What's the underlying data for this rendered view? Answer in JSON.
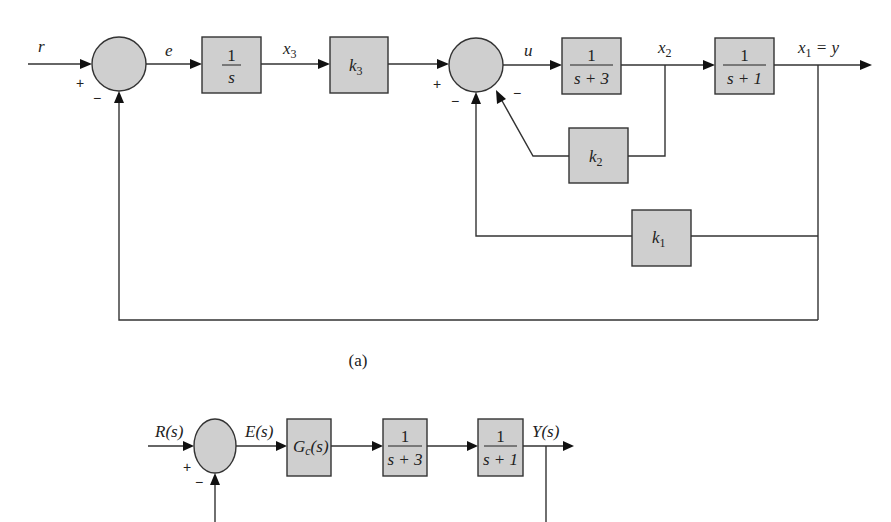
{
  "diagram_a": {
    "caption": "(a)",
    "signals": {
      "r": "r",
      "e": "e",
      "x3": {
        "base": "x",
        "sub": "3"
      },
      "u": "u",
      "x2": {
        "base": "x",
        "sub": "2"
      },
      "x1": {
        "base": "x",
        "sub": "1",
        "rest": " = y"
      }
    },
    "blocks": {
      "integrator": {
        "num": "1",
        "den": "s"
      },
      "k3": {
        "base": "k",
        "sub": "3"
      },
      "plant1": {
        "num": "1",
        "den": "s + 3"
      },
      "plant2": {
        "num": "1",
        "den": "s + 1"
      },
      "k2": {
        "base": "k",
        "sub": "2"
      },
      "k1": {
        "base": "k",
        "sub": "1"
      }
    },
    "signs": {
      "sum1_plus": "+",
      "sum1_minus": "−",
      "sum2_plus": "+",
      "sum2_minus_bottom": "−",
      "sum2_minus_diag": "−"
    }
  },
  "diagram_b": {
    "signals": {
      "R": "R(s)",
      "E": "E(s)",
      "Y": "Y(s)"
    },
    "blocks": {
      "controller": {
        "base": "G",
        "sub": "c",
        "rest": "(s)"
      },
      "plant1": {
        "num": "1",
        "den": "s + 3"
      },
      "plant2": {
        "num": "1",
        "den": "s + 1"
      }
    },
    "signs": {
      "sum_plus": "+",
      "sum_minus": "−"
    }
  },
  "colors": {
    "block_fill": "#cfcfcf",
    "line": "#333333",
    "background": "#ffffff"
  }
}
